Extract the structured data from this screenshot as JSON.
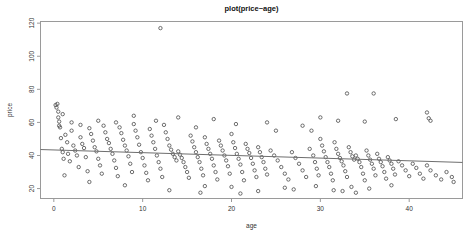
{
  "chart_data": {
    "type": "scatter",
    "title": "plot(price~age)",
    "xlabel": "age",
    "ylabel": "price",
    "xlim": [
      -1.5,
      46.0
    ],
    "ylim": [
      14.0,
      121.0
    ],
    "xticks": [
      0,
      10,
      20,
      30,
      40
    ],
    "xticklabels": [
      "0",
      "10",
      "20",
      "30",
      "40"
    ],
    "yticks": [
      20,
      40,
      60,
      80,
      100,
      120
    ],
    "yticklabels": [
      "20",
      "40",
      "60",
      "80",
      "100",
      "120"
    ],
    "grid": false,
    "legend": null,
    "marker": "open-circle",
    "marker_color": "#4a4a4a",
    "fit_line": {
      "type": "linear-regression",
      "color": "#6e6e6e",
      "x_start": -1.5,
      "y_start": 43.6,
      "x_end": 46.0,
      "y_end": 35.8
    },
    "points": [
      [
        0.2,
        70.5
      ],
      [
        0.3,
        69.0
      ],
      [
        0.4,
        71.2
      ],
      [
        0.5,
        63.0
      ],
      [
        0.6,
        58.0
      ],
      [
        0.7,
        57.0
      ],
      [
        0.8,
        50.5
      ],
      [
        0.9,
        44.0
      ],
      [
        1.0,
        42.0
      ],
      [
        1.1,
        38.0
      ],
      [
        1.3,
        52.5
      ],
      [
        1.5,
        48.0
      ],
      [
        1.6,
        41.0
      ],
      [
        1.8,
        36.5
      ],
      [
        2.0,
        55.0
      ],
      [
        2.2,
        46.0
      ],
      [
        2.4,
        43.0
      ],
      [
        2.6,
        40.0
      ],
      [
        2.8,
        33.0
      ],
      [
        3.0,
        51.0
      ],
      [
        3.2,
        47.0
      ],
      [
        3.4,
        44.5
      ],
      [
        3.6,
        39.0
      ],
      [
        3.8,
        30.5
      ],
      [
        4.0,
        56.5
      ],
      [
        4.2,
        53.0
      ],
      [
        4.4,
        49.0
      ],
      [
        4.6,
        45.0
      ],
      [
        4.8,
        42.5
      ],
      [
        5.0,
        38.0
      ],
      [
        5.2,
        34.0
      ],
      [
        5.4,
        29.0
      ],
      [
        5.6,
        58.0
      ],
      [
        5.8,
        54.0
      ],
      [
        6.0,
        50.0
      ],
      [
        6.2,
        47.5
      ],
      [
        6.4,
        44.0
      ],
      [
        6.6,
        41.0
      ],
      [
        6.8,
        37.0
      ],
      [
        7.0,
        32.5
      ],
      [
        7.2,
        27.5
      ],
      [
        7.4,
        57.0
      ],
      [
        7.6,
        53.5
      ],
      [
        7.8,
        49.5
      ],
      [
        8.0,
        46.0
      ],
      [
        8.2,
        43.0
      ],
      [
        8.4,
        39.5
      ],
      [
        8.6,
        35.0
      ],
      [
        8.8,
        30.0
      ],
      [
        9.0,
        59.0
      ],
      [
        9.2,
        55.0
      ],
      [
        9.4,
        51.0
      ],
      [
        9.6,
        46.5
      ],
      [
        9.8,
        42.0
      ],
      [
        10.0,
        38.5
      ],
      [
        10.2,
        34.0
      ],
      [
        10.4,
        29.5
      ],
      [
        10.6,
        25.0
      ],
      [
        10.8,
        56.0
      ],
      [
        11.0,
        52.0
      ],
      [
        11.2,
        48.0
      ],
      [
        11.4,
        44.0
      ],
      [
        11.6,
        40.0
      ],
      [
        11.8,
        36.0
      ],
      [
        12.0,
        32.0
      ],
      [
        12.2,
        27.0
      ],
      [
        12.4,
        58.5
      ],
      [
        12.6,
        54.0
      ],
      [
        12.8,
        50.0
      ],
      [
        13.0,
        46.0
      ],
      [
        13.2,
        43.5
      ],
      [
        13.4,
        41.0
      ],
      [
        13.6,
        39.0
      ],
      [
        13.8,
        37.0
      ],
      [
        14.0,
        42.5
      ],
      [
        14.2,
        40.5
      ],
      [
        14.4,
        38.5
      ],
      [
        14.6,
        36.0
      ],
      [
        14.8,
        33.0
      ],
      [
        15.0,
        30.0
      ],
      [
        15.2,
        26.5
      ],
      [
        15.4,
        52.0
      ],
      [
        15.6,
        48.5
      ],
      [
        15.8,
        45.0
      ],
      [
        16.0,
        42.0
      ],
      [
        16.2,
        39.0
      ],
      [
        16.4,
        36.0
      ],
      [
        16.6,
        32.0
      ],
      [
        16.8,
        28.0
      ],
      [
        17.0,
        51.0
      ],
      [
        17.2,
        47.0
      ],
      [
        17.4,
        44.0
      ],
      [
        17.6,
        41.0
      ],
      [
        17.8,
        38.0
      ],
      [
        18.0,
        34.0
      ],
      [
        18.2,
        30.0
      ],
      [
        18.4,
        25.5
      ],
      [
        18.6,
        49.0
      ],
      [
        18.8,
        46.0
      ],
      [
        19.0,
        43.0
      ],
      [
        19.2,
        40.0
      ],
      [
        19.4,
        37.0
      ],
      [
        19.6,
        33.5
      ],
      [
        19.8,
        29.0
      ],
      [
        20.0,
        53.0
      ],
      [
        20.2,
        48.0
      ],
      [
        20.4,
        44.5
      ],
      [
        20.6,
        41.0
      ],
      [
        20.8,
        38.0
      ],
      [
        21.0,
        34.5
      ],
      [
        21.2,
        30.0
      ],
      [
        21.4,
        25.0
      ],
      [
        21.6,
        47.0
      ],
      [
        21.8,
        44.0
      ],
      [
        22.0,
        41.5
      ],
      [
        22.2,
        38.5
      ],
      [
        22.4,
        35.0
      ],
      [
        22.6,
        31.0
      ],
      [
        22.8,
        27.0
      ],
      [
        23.0,
        45.0
      ],
      [
        23.2,
        42.0
      ],
      [
        23.4,
        39.0
      ],
      [
        23.6,
        36.0
      ],
      [
        23.8,
        32.0
      ],
      [
        24.0,
        28.5
      ],
      [
        24.4,
        43.0
      ],
      [
        24.8,
        40.0
      ],
      [
        25.2,
        37.0
      ],
      [
        25.6,
        33.0
      ],
      [
        26.0,
        29.0
      ],
      [
        26.4,
        25.5
      ],
      [
        26.8,
        42.0
      ],
      [
        27.2,
        38.5
      ],
      [
        27.6,
        35.0
      ],
      [
        28.0,
        31.0
      ],
      [
        28.4,
        27.0
      ],
      [
        28.8,
        44.0
      ],
      [
        29.0,
        55.0
      ],
      [
        29.2,
        40.0
      ],
      [
        29.4,
        36.0
      ],
      [
        29.6,
        32.0
      ],
      [
        29.8,
        28.0
      ],
      [
        30.0,
        50.0
      ],
      [
        30.2,
        46.0
      ],
      [
        30.4,
        42.5
      ],
      [
        30.6,
        39.0
      ],
      [
        30.8,
        36.0
      ],
      [
        31.0,
        33.0
      ],
      [
        31.2,
        29.0
      ],
      [
        31.4,
        25.0
      ],
      [
        31.6,
        48.0
      ],
      [
        31.8,
        44.0
      ],
      [
        32.0,
        41.0
      ],
      [
        32.2,
        38.5
      ],
      [
        32.4,
        36.5
      ],
      [
        32.6,
        34.0
      ],
      [
        32.8,
        30.5
      ],
      [
        33.0,
        27.0
      ],
      [
        33.2,
        45.0
      ],
      [
        33.4,
        42.0
      ],
      [
        33.6,
        39.5
      ],
      [
        33.8,
        37.5
      ],
      [
        34.0,
        40.0
      ],
      [
        34.2,
        38.0
      ],
      [
        34.4,
        36.0
      ],
      [
        34.6,
        33.0
      ],
      [
        34.8,
        29.0
      ],
      [
        35.0,
        25.0
      ],
      [
        35.2,
        43.0
      ],
      [
        35.4,
        40.0
      ],
      [
        35.6,
        37.5
      ],
      [
        35.8,
        35.0
      ],
      [
        36.0,
        32.0
      ],
      [
        36.2,
        28.0
      ],
      [
        36.4,
        41.0
      ],
      [
        36.6,
        38.0
      ],
      [
        36.8,
        36.0
      ],
      [
        37.0,
        33.5
      ],
      [
        37.2,
        30.0
      ],
      [
        37.4,
        26.0
      ],
      [
        37.6,
        39.0
      ],
      [
        37.8,
        37.0
      ],
      [
        38.0,
        35.0
      ],
      [
        38.2,
        32.0
      ],
      [
        38.4,
        28.5
      ],
      [
        38.8,
        36.5
      ],
      [
        39.2,
        34.0
      ],
      [
        39.6,
        31.0
      ],
      [
        40.0,
        27.5
      ],
      [
        40.4,
        35.0
      ],
      [
        40.8,
        32.5
      ],
      [
        41.2,
        29.0
      ],
      [
        41.6,
        26.0
      ],
      [
        42.0,
        34.0
      ],
      [
        42.4,
        31.0
      ],
      [
        43.0,
        28.0
      ],
      [
        43.6,
        25.5
      ],
      [
        44.2,
        30.0
      ],
      [
        12.0,
        117.0
      ],
      [
        33.0,
        77.5
      ],
      [
        36.0,
        77.5
      ],
      [
        42.0,
        66.0
      ],
      [
        42.2,
        62.5
      ],
      [
        42.4,
        61.0
      ],
      [
        38.5,
        62.0
      ],
      [
        35.0,
        60.5
      ],
      [
        32.0,
        61.0
      ],
      [
        28.0,
        58.0
      ],
      [
        30.0,
        63.0
      ],
      [
        25.0,
        55.0
      ],
      [
        24.0,
        60.0
      ],
      [
        20.5,
        59.0
      ],
      [
        18.0,
        62.0
      ],
      [
        16.0,
        57.0
      ],
      [
        14.0,
        63.0
      ],
      [
        11.5,
        61.0
      ],
      [
        9.0,
        64.0
      ],
      [
        7.0,
        60.0
      ],
      [
        5.0,
        61.0
      ],
      [
        3.0,
        58.5
      ],
      [
        2.0,
        60.0
      ],
      [
        1.0,
        65.0
      ],
      [
        0.5,
        66.5
      ],
      [
        0.6,
        60.5
      ],
      [
        44.8,
        27.0
      ],
      [
        45.0,
        24.0
      ],
      [
        26.0,
        20.5
      ],
      [
        27.0,
        19.5
      ],
      [
        31.5,
        19.0
      ],
      [
        32.5,
        18.5
      ],
      [
        35.5,
        20.0
      ],
      [
        23.0,
        18.5
      ],
      [
        16.5,
        17.5
      ],
      [
        20.0,
        21.0
      ],
      [
        13.0,
        19.0
      ],
      [
        8.0,
        22.0
      ],
      [
        4.0,
        24.0
      ],
      [
        1.2,
        28.0
      ],
      [
        38.0,
        22.0
      ],
      [
        29.5,
        21.5
      ],
      [
        34.0,
        17.5
      ],
      [
        33.5,
        21.0
      ],
      [
        21.0,
        17.0
      ],
      [
        17.0,
        21.5
      ]
    ]
  }
}
